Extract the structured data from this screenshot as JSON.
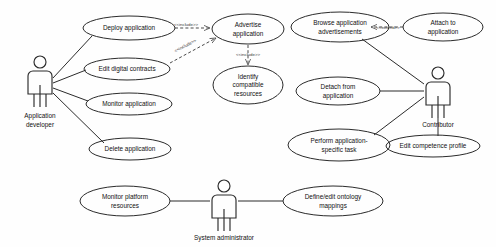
{
  "diagram": {
    "type": "uml-use-case-diagram",
    "background_color": "#fefefe",
    "line_color": "#2b2b2b",
    "actors": [
      {
        "id": "application-developer",
        "label": "Application developer",
        "x": 40,
        "y": 82
      },
      {
        "id": "contributor",
        "label": "Contributor",
        "x": 438,
        "y": 92
      },
      {
        "id": "system-administrator",
        "label": "System administrator",
        "x": 224,
        "y": 205
      }
    ],
    "use_cases": [
      {
        "id": "deploy-application",
        "lines": [
          "Deploy application"
        ],
        "cx": 129,
        "cy": 28,
        "rx": 46,
        "ry": 12
      },
      {
        "id": "edit-digital-contracts",
        "lines": [
          "Edit digital contracts"
        ],
        "cx": 127,
        "cy": 69,
        "rx": 43,
        "ry": 11
      },
      {
        "id": "monitor-application",
        "lines": [
          "Monitor application"
        ],
        "cx": 129,
        "cy": 104,
        "rx": 43,
        "ry": 11
      },
      {
        "id": "delete-application",
        "lines": [
          "Delete application"
        ],
        "cx": 130,
        "cy": 149,
        "rx": 41,
        "ry": 11
      },
      {
        "id": "advertise-application",
        "lines": [
          "Advertise",
          "application"
        ],
        "cx": 248,
        "cy": 29,
        "rx": 36,
        "ry": 15
      },
      {
        "id": "identify-compatible-resources",
        "lines": [
          "Identify",
          "compatible",
          "resources"
        ],
        "cx": 248,
        "cy": 85,
        "rx": 35,
        "ry": 19
      },
      {
        "id": "browse-application-advertisements",
        "lines": [
          "Browse application",
          "advertisements"
        ],
        "cx": 340,
        "cy": 27,
        "rx": 49,
        "ry": 15
      },
      {
        "id": "attach-to-application",
        "lines": [
          "Attach to",
          "application"
        ],
        "cx": 443,
        "cy": 27,
        "rx": 40,
        "ry": 14
      },
      {
        "id": "detach-from-application",
        "lines": [
          "Detach from",
          "application"
        ],
        "cx": 338,
        "cy": 91,
        "rx": 42,
        "ry": 14
      },
      {
        "id": "perform-application-specific-task",
        "lines": [
          "Perform application-",
          "specific task"
        ],
        "cx": 339,
        "cy": 145,
        "rx": 51,
        "ry": 16
      },
      {
        "id": "edit-competence-profile",
        "lines": [
          "Edit competence profile"
        ],
        "cx": 433,
        "cy": 146,
        "rx": 47,
        "ry": 11
      },
      {
        "id": "monitor-platform-resources",
        "lines": [
          "Monitor platform",
          "resources"
        ],
        "cx": 125,
        "cy": 201,
        "rx": 45,
        "ry": 15
      },
      {
        "id": "define-edit-ontology-mappings",
        "lines": [
          "Define/edit ontology",
          "mappings"
        ],
        "cx": 333,
        "cy": 201,
        "rx": 50,
        "ry": 15
      }
    ],
    "stereotypes": [
      {
        "id": "include-deploy-advertise",
        "text": "<<include>>",
        "x": 186,
        "y": 26
      },
      {
        "id": "include-contracts-advertise",
        "text": "<<include>>",
        "x": 186,
        "y": 47
      },
      {
        "id": "include-advertise-identify",
        "text": "<<include>>",
        "x": 248,
        "y": 57
      },
      {
        "id": "extend-browse-attach",
        "text": "<<extend>>",
        "x": 388,
        "y": 27
      }
    ],
    "associations": [
      {
        "from": "application-developer",
        "to": "deploy-application"
      },
      {
        "from": "application-developer",
        "to": "edit-digital-contracts"
      },
      {
        "from": "application-developer",
        "to": "monitor-application"
      },
      {
        "from": "application-developer",
        "to": "delete-application"
      },
      {
        "from": "browse-application-advertisements",
        "to": "contributor"
      },
      {
        "from": "detach-from-application",
        "to": "contributor"
      },
      {
        "from": "perform-application-specific-task",
        "to": "contributor"
      },
      {
        "from": "contributor",
        "to": "edit-competence-profile"
      },
      {
        "from": "monitor-platform-resources",
        "to": "system-administrator"
      },
      {
        "from": "system-administrator",
        "to": "define-edit-ontology-mappings"
      }
    ]
  }
}
